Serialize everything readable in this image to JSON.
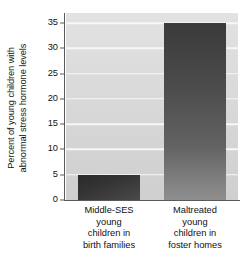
{
  "chart_data": {
    "type": "bar",
    "title": "",
    "xlabel": "",
    "ylabel": "Percent of young children with abnormal stress hormone levels",
    "ylabel_lines": [
      "Percent of young children with",
      "abnormal stress hormone levels"
    ],
    "categories": [
      "Middle-SES young children in birth families",
      "Maltreated young children in foster homes"
    ],
    "category_lines": [
      [
        "Middle-SES",
        "young",
        "children in",
        "birth families"
      ],
      [
        "Maltreated",
        "young",
        "children in",
        "foster homes"
      ]
    ],
    "values": [
      5,
      35
    ],
    "ylim": [
      0,
      37
    ],
    "yticks": [
      0,
      5,
      10,
      15,
      20,
      25,
      30,
      35
    ],
    "ytick_labels": [
      "0",
      "5",
      "10",
      "15",
      "20",
      "25",
      "30",
      "35"
    ],
    "grid": true,
    "grid_axis": "y",
    "legend": false,
    "bar_colors": [
      "#343434",
      "#5a5a5a"
    ],
    "plot_background": "#dadada",
    "gridline_color": "#f7f7f7",
    "axis_color": "#5a5a5a",
    "text_color": "#111111"
  }
}
